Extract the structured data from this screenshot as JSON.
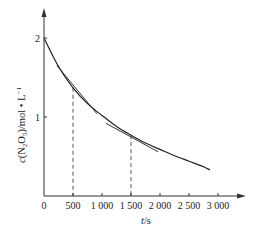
{
  "chart_data": {
    "type": "line",
    "title": "",
    "xlabel": "t/s",
    "ylabel": "c(N2O5)/mol • L-1",
    "xlim": [
      0,
      3400
    ],
    "ylim": [
      0,
      2.5
    ],
    "x_ticks": [
      0,
      500,
      1000,
      1500,
      2000,
      2500,
      3000
    ],
    "x_tick_labels": [
      "0",
      "500",
      "1 000",
      "1 500",
      "2 000",
      "2 500",
      "3 000"
    ],
    "y_ticks": [
      1,
      2
    ],
    "y_tick_labels": [
      "1",
      "2"
    ],
    "grid": false,
    "legend": null,
    "series": [
      {
        "name": "c(N2O5) concentration curve",
        "x": [
          0,
          250,
          500,
          750,
          1000,
          1250,
          1500,
          1750,
          2000,
          2250,
          2500,
          2750,
          2860
        ],
        "values": [
          2.0,
          1.64,
          1.37,
          1.17,
          1.02,
          0.88,
          0.77,
          0.67,
          0.59,
          0.51,
          0.44,
          0.37,
          0.33
        ]
      }
    ],
    "tangents": [
      {
        "at_t": 500,
        "x": [
          224,
          914
        ],
        "values": [
          1.65,
          1.04
        ]
      },
      {
        "at_t": 1500,
        "x": [
          1069,
          1966
        ],
        "values": [
          0.92,
          0.56
        ]
      }
    ],
    "dashed_guides": [
      {
        "t": 500,
        "c": 1.37
      },
      {
        "t": 1500,
        "c": 0.77
      }
    ]
  },
  "axes": {
    "x_title_italic": "t",
    "x_title_rest": "/s",
    "y_title_c": "c",
    "y_title_main": "(N",
    "y_title_sub1": "2",
    "y_title_mid": "O",
    "y_title_sub2": "5",
    "y_title_unit": ")/mol • L",
    "y_title_sup": "−1"
  }
}
